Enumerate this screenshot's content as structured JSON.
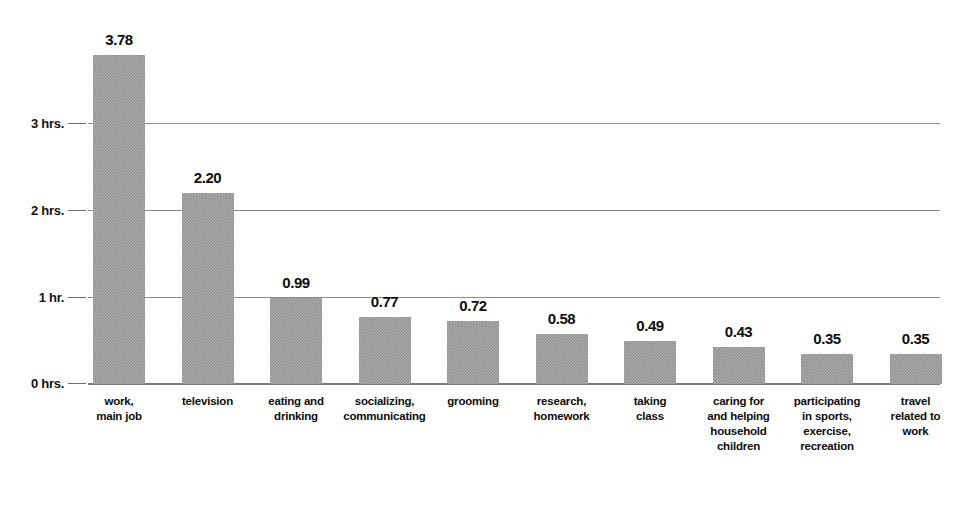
{
  "chart_data": {
    "type": "bar",
    "title": "",
    "subtitle": "",
    "xlabel": "",
    "ylabel": "",
    "ylim": [
      0,
      4
    ],
    "grid": true,
    "legend": "none",
    "orientation": "vertical",
    "value_label_format": "0.00",
    "units": "hours per day",
    "yticks": [
      {
        "value": 0,
        "label": "0 hrs."
      },
      {
        "value": 1,
        "label": "1 hr."
      },
      {
        "value": 2,
        "label": "2 hrs."
      },
      {
        "value": 3,
        "label": "3 hrs."
      }
    ],
    "categories": [
      "work, main job",
      "television",
      "eating and drinking",
      "socializing, communicating",
      "grooming",
      "research, homework",
      "taking class",
      "caring for and helping household children",
      "participating in sports, exercise, recreation",
      "travel related to work"
    ],
    "category_lines": [
      [
        "work,",
        "main job"
      ],
      [
        "television"
      ],
      [
        "eating and",
        "drinking"
      ],
      [
        "socializing,",
        "communicating"
      ],
      [
        "grooming"
      ],
      [
        "research,",
        "homework"
      ],
      [
        "taking",
        "class"
      ],
      [
        "caring for",
        "and helping",
        "household",
        "children"
      ],
      [
        "participating",
        "in sports,",
        "exercise,",
        "recreation"
      ],
      [
        "travel",
        "related to",
        "work"
      ]
    ],
    "values": [
      3.78,
      2.2,
      0.99,
      0.77,
      0.72,
      0.58,
      0.49,
      0.43,
      0.35,
      0.35
    ],
    "value_labels": [
      "3.78",
      "2.20",
      "0.99",
      "0.77",
      "0.72",
      "0.58",
      "0.49",
      "0.43",
      "0.35",
      "0.35"
    ],
    "colors": {
      "bar_fill": "#a9a9a9",
      "bar_pattern": "#8d8d8d",
      "gridline": "#8c8c8c",
      "baseline": "#7a7a7a",
      "text": "#0d0d0d",
      "background": "#ffffff"
    }
  }
}
